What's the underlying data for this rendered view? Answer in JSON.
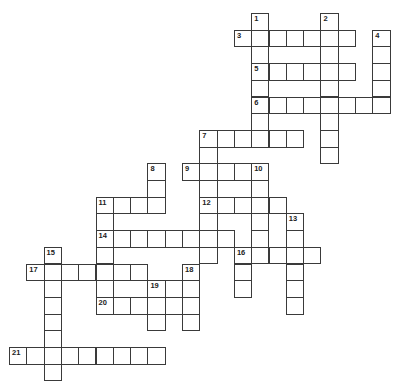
{
  "puzzle": {
    "type": "crossword",
    "grid": {
      "origin_x": 9,
      "origin_y": 13,
      "cell_w": 17.3,
      "cell_h": 16.7,
      "line_color": "#3a3a3a"
    },
    "across": [
      {
        "number": "3",
        "row": 1,
        "col": 13,
        "length": 7
      },
      {
        "number": "5",
        "row": 3,
        "col": 14,
        "length": 6
      },
      {
        "number": "6",
        "row": 5,
        "col": 14,
        "length": 8
      },
      {
        "number": "7",
        "row": 7,
        "col": 11,
        "length": 6
      },
      {
        "number": "9",
        "row": 9,
        "col": 10,
        "length": 5
      },
      {
        "number": "11",
        "row": 11,
        "col": 5,
        "length": 4
      },
      {
        "number": "12",
        "row": 11,
        "col": 11,
        "length": 5
      },
      {
        "number": "14",
        "row": 13,
        "col": 5,
        "length": 8
      },
      {
        "number": "16",
        "row": 14,
        "col": 13,
        "length": 5
      },
      {
        "number": "17",
        "row": 15,
        "col": 1,
        "length": 7
      },
      {
        "number": "19",
        "row": 16,
        "col": 8,
        "length": 3
      },
      {
        "number": "20",
        "row": 17,
        "col": 5,
        "length": 6
      },
      {
        "number": "21",
        "row": 20,
        "col": 0,
        "length": 9
      }
    ],
    "down": [
      {
        "number": "1",
        "row": 0,
        "col": 14,
        "length": 8
      },
      {
        "number": "2",
        "row": 0,
        "col": 18,
        "length": 9
      },
      {
        "number": "4",
        "row": 1,
        "col": 21,
        "length": 5
      },
      {
        "number": "7",
        "row": 7,
        "col": 11,
        "length": 8
      },
      {
        "number": "8",
        "row": 9,
        "col": 8,
        "length": 3
      },
      {
        "number": "10",
        "row": 9,
        "col": 14,
        "length": 6
      },
      {
        "number": "11",
        "row": 11,
        "col": 5,
        "length": 7
      },
      {
        "number": "13",
        "row": 12,
        "col": 16,
        "length": 6
      },
      {
        "number": "15",
        "row": 14,
        "col": 2,
        "length": 8
      },
      {
        "number": "16",
        "row": 14,
        "col": 13,
        "length": 3
      },
      {
        "number": "18",
        "row": 15,
        "col": 10,
        "length": 4
      },
      {
        "number": "19",
        "row": 16,
        "col": 8,
        "length": 3
      }
    ]
  }
}
